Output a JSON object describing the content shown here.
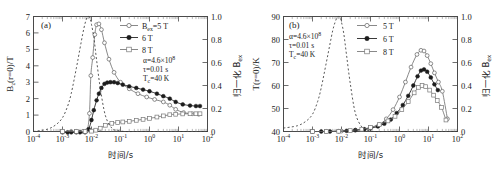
{
  "figure": {
    "panels": [
      "a",
      "b"
    ],
    "background": "#ffffff"
  },
  "panel_a": {
    "tag": "(a)",
    "annotations": {
      "alpha": "α=4.6×10",
      "alpha_exp": "8",
      "tau": "τ=0.01 s",
      "tc": "T",
      "tc_sub": "c",
      "tc_val": "=40 K"
    },
    "legend": [
      {
        "label_main": "B",
        "label_sub": "ex",
        "label_tail": "=5 T",
        "marker": "open-circle",
        "color": "#6b6b6b"
      },
      {
        "label_main": "",
        "label_sub": "",
        "label_tail": "6 T",
        "marker": "filled-circle",
        "color": "#1c1c1c"
      },
      {
        "label_main": "",
        "label_sub": "",
        "label_tail": "8 T",
        "marker": "open-square",
        "color": "#8a8a8a"
      }
    ],
    "axes": {
      "x_label": "时间/s",
      "x_ticks": [
        "10",
        "10",
        "10",
        "10",
        "10",
        "10",
        "10"
      ],
      "x_exps": [
        "-4",
        "-3",
        "-2",
        "-1",
        "0",
        "1",
        "2"
      ],
      "y_left_label_main": "B",
      "y_left_label_sub": "z",
      "y_left_label_tail": "(r=0)/T",
      "y_left_ticks": [
        "0",
        "1",
        "2",
        "3",
        "4",
        "5",
        "6",
        "7"
      ],
      "y_right_label": "归一化 B",
      "y_right_label_sub": "ex",
      "y_right_ticks": [
        "0",
        "0.2",
        "0.4",
        "0.6",
        "0.8",
        "1.0"
      ]
    }
  },
  "panel_b": {
    "tag": "(b)",
    "annotations": {
      "alpha": "α=4.6×10",
      "alpha_exp": "8",
      "tau": "τ=0.01 s",
      "tc": "T",
      "tc_sub": "c",
      "tc_val": "=40 K"
    },
    "legend": [
      {
        "label_tail": "5 T",
        "marker": "open-circle",
        "color": "#6b6b6b"
      },
      {
        "label_tail": "6 T",
        "marker": "filled-circle",
        "color": "#1c1c1c"
      },
      {
        "label_tail": "8 T",
        "marker": "open-square",
        "color": "#8a8a8a"
      }
    ],
    "axes": {
      "x_label": "时间/s",
      "x_ticks": [
        "10",
        "10",
        "10",
        "10",
        "10",
        "10",
        "10"
      ],
      "x_exps": [
        "-4",
        "-3",
        "-2",
        "-1",
        "0",
        "1",
        "2"
      ],
      "y_left_label_main": "T",
      "y_left_label_tail": "(r=0)/K",
      "y_left_ticks": [
        "40",
        "50",
        "60",
        "70",
        "80",
        "90"
      ],
      "y_right_label": "归一化 B",
      "y_right_label_sub": "ex",
      "y_right_ticks": [
        "0",
        "0.2",
        "0.4",
        "0.6",
        "0.8",
        "1.0"
      ]
    }
  },
  "chart_data": [
    {
      "type": "line",
      "panel": "a",
      "title": "(a) Trapped field B_z(r=0) vs time",
      "xlabel": "时间/s",
      "ylabel": "B_z(r=0)/T",
      "ylabel_right": "归一化 B_ex",
      "xscale": "log",
      "xlim": [
        0.0001,
        100
      ],
      "ylim": [
        0,
        7
      ],
      "ylim_right": [
        0,
        1.0
      ],
      "grid": false,
      "legend_position": "upper-right",
      "annotations": [
        "α=4.6×10^8",
        "τ=0.01 s",
        "T_c=40 K"
      ],
      "series": [
        {
          "name": "B_ex=5 T",
          "marker": "open-circle",
          "axis": "left",
          "x": [
            0.001,
            0.002,
            0.003,
            0.005,
            0.007,
            0.0085,
            0.0095,
            0.011,
            0.013,
            0.015,
            0.018,
            0.022,
            0.028,
            0.04,
            0.06,
            0.1,
            0.2,
            0.4,
            0.8,
            1.5,
            3,
            5,
            8,
            15,
            30,
            50
          ],
          "y": [
            0.0,
            0.0,
            0.0,
            0.0,
            0.05,
            1.1,
            3.4,
            4.5,
            5.9,
            6.5,
            6.55,
            6.2,
            5.4,
            4.4,
            3.6,
            3.0,
            2.6,
            2.3,
            2.1,
            1.95,
            1.8,
            1.6,
            1.35,
            1.15,
            1.08,
            1.05
          ]
        },
        {
          "name": "6 T",
          "marker": "filled-circle",
          "axis": "left",
          "x": [
            0.001,
            0.0015,
            0.002,
            0.003,
            0.004,
            0.006,
            0.008,
            0.01,
            0.012,
            0.015,
            0.018,
            0.022,
            0.028,
            0.035,
            0.045,
            0.06,
            0.08,
            0.12,
            0.2,
            0.35,
            0.6,
            1.0,
            1.8,
            3,
            5,
            8,
            14,
            25,
            40,
            55
          ],
          "y": [
            -0.05,
            -0.05,
            -0.05,
            -0.05,
            -0.05,
            -0.05,
            0.15,
            0.7,
            1.3,
            1.9,
            2.3,
            2.65,
            2.9,
            2.98,
            3.0,
            3.0,
            2.95,
            2.85,
            2.75,
            2.65,
            2.55,
            2.45,
            2.3,
            2.15,
            2.0,
            1.8,
            1.65,
            1.58,
            1.55,
            1.55
          ]
        },
        {
          "name": "8 T",
          "marker": "open-square",
          "axis": "left",
          "x": [
            0.001,
            0.003,
            0.006,
            0.01,
            0.014,
            0.02,
            0.03,
            0.05,
            0.08,
            0.12,
            0.2,
            0.35,
            0.6,
            1.0,
            1.8,
            3,
            5,
            8,
            14,
            25,
            40,
            55
          ],
          "y": [
            0.0,
            0.0,
            0.0,
            0.02,
            0.08,
            0.2,
            0.38,
            0.5,
            0.55,
            0.58,
            0.62,
            0.68,
            0.74,
            0.8,
            0.88,
            0.95,
            1.02,
            1.05,
            1.07,
            1.08,
            1.08,
            1.08
          ]
        },
        {
          "name": "B_ex normalized (applied field pulse)",
          "marker": "none",
          "style": "dashed",
          "axis": "right",
          "x": [
            0.0001,
            0.0003,
            0.0006,
            0.001,
            0.0015,
            0.002,
            0.003,
            0.004,
            0.005,
            0.006,
            0.007,
            0.008,
            0.009,
            0.01,
            0.012,
            0.015,
            0.02,
            0.03,
            0.05,
            0.08,
            0.15,
            0.3,
            1,
            10,
            100
          ],
          "y": [
            0.0,
            0.02,
            0.06,
            0.12,
            0.22,
            0.33,
            0.55,
            0.72,
            0.85,
            0.94,
            0.99,
            1.0,
            0.98,
            0.93,
            0.82,
            0.62,
            0.38,
            0.14,
            0.03,
            0.008,
            0.0,
            0.0,
            0.0,
            0.0,
            0.0
          ]
        }
      ]
    },
    {
      "type": "line",
      "panel": "b",
      "title": "(b) Center temperature T(r=0) vs time",
      "xlabel": "时间/s",
      "ylabel": "T(r=0)/K",
      "ylabel_right": "归一化 B_ex",
      "xscale": "log",
      "xlim": [
        0.0001,
        100
      ],
      "ylim": [
        40,
        90
      ],
      "ylim_right": [
        0,
        1.0
      ],
      "grid": false,
      "legend_position": "upper-right",
      "annotations": [
        "α=4.6×10^8",
        "τ=0.01 s",
        "T_c=40 K"
      ],
      "series": [
        {
          "name": "5 T",
          "marker": "open-circle",
          "axis": "left",
          "x": [
            0.001,
            0.003,
            0.01,
            0.03,
            0.06,
            0.1,
            0.2,
            0.35,
            0.6,
            1.0,
            1.6,
            2.5,
            4,
            5.5,
            7,
            9,
            12,
            16,
            22,
            30,
            45
          ],
          "y": [
            40.0,
            40.0,
            40.2,
            40.6,
            41.0,
            41.6,
            43.0,
            45.5,
            49.5,
            55.0,
            61.5,
            68.0,
            73.5,
            75.3,
            75.0,
            73.0,
            69.5,
            65.5,
            61.5,
            57.5,
            45.5
          ]
        },
        {
          "name": "6 T",
          "marker": "filled-circle",
          "axis": "left",
          "x": [
            0.001,
            0.002,
            0.004,
            0.008,
            0.015,
            0.03,
            0.06,
            0.1,
            0.18,
            0.3,
            0.5,
            0.8,
            1.3,
            2.0,
            3.0,
            4.2,
            5.5,
            7,
            9,
            12,
            16,
            21
          ],
          "y": [
            40.0,
            40.0,
            40.0,
            40.1,
            40.3,
            40.6,
            41.0,
            41.4,
            42.2,
            43.4,
            45.2,
            48.0,
            51.5,
            55.5,
            60.0,
            64.0,
            66.5,
            67.0,
            66.0,
            63.5,
            60.5,
            58.0
          ]
        },
        {
          "name": "8 T",
          "marker": "open-square",
          "axis": "left",
          "x": [
            0.001,
            0.003,
            0.008,
            0.02,
            0.05,
            0.1,
            0.2,
            0.4,
            0.7,
            1.2,
            2.0,
            3.2,
            4.5,
            6,
            8,
            11,
            15,
            20,
            28,
            40
          ],
          "y": [
            40.0,
            40.0,
            40.1,
            40.4,
            41.0,
            41.8,
            43.0,
            44.6,
            46.6,
            49.5,
            53.0,
            56.8,
            59.2,
            60.0,
            59.5,
            58.0,
            55.8,
            53.5,
            50.5,
            45.0
          ]
        },
        {
          "name": "B_ex normalized (applied field pulse)",
          "marker": "none",
          "style": "dashed",
          "axis": "right",
          "x": [
            0.0001,
            0.0003,
            0.0006,
            0.001,
            0.0015,
            0.002,
            0.003,
            0.004,
            0.005,
            0.006,
            0.007,
            0.008,
            0.009,
            0.01,
            0.012,
            0.015,
            0.02,
            0.03,
            0.05,
            0.08,
            0.15,
            0.3,
            1,
            10,
            100
          ],
          "y": [
            0.03,
            0.05,
            0.09,
            0.15,
            0.26,
            0.38,
            0.6,
            0.76,
            0.88,
            0.95,
            0.99,
            1.0,
            0.99,
            0.95,
            0.85,
            0.66,
            0.42,
            0.16,
            0.04,
            0.01,
            0.0,
            0.0,
            0.0,
            0.0,
            0.0
          ]
        }
      ]
    }
  ]
}
